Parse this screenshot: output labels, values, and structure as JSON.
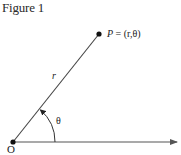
{
  "figure": {
    "title": "Figure 1",
    "point_label": {
      "name": "P",
      "equals": " = ",
      "coords": "(r,θ)"
    },
    "radius_label": "r",
    "angle_label": "θ",
    "origin_label": "O",
    "elements": {
      "origin_point": [
        13,
        142
      ],
      "point_p": [
        99,
        34
      ],
      "polar_axis_end": [
        178,
        142
      ]
    },
    "colors": {
      "stroke": "#444444",
      "points": "#111111",
      "background": "#ffffff"
    }
  }
}
